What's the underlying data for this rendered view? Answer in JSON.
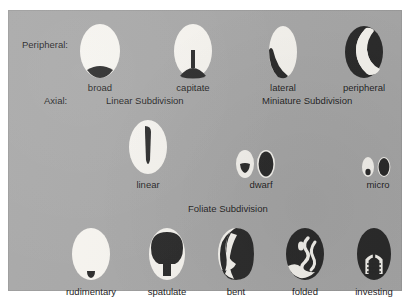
{
  "figure": {
    "background_color": "#ffffff",
    "plate_color": "#a8a8a8",
    "seed_body_color": "#f7f5f0",
    "embryo_color": "#2b2b2b"
  },
  "rows": {
    "peripheral_label": "Peripheral:",
    "axial_label": "Axial:"
  },
  "groups": {
    "linear": "Linear Subdivision",
    "miniature": "Miniature Subdivision",
    "foliate": "Foliate Subdivision"
  },
  "specimens": {
    "peripheral_row": [
      {
        "id": "broad",
        "caption": "broad"
      },
      {
        "id": "capitate",
        "caption": "capitate"
      },
      {
        "id": "lateral",
        "caption": "lateral"
      },
      {
        "id": "peripheral",
        "caption": "peripheral"
      }
    ],
    "axial_row": [
      {
        "id": "linear",
        "caption": "linear"
      },
      {
        "id": "dwarf",
        "caption": "dwarf"
      },
      {
        "id": "micro",
        "caption": "micro"
      }
    ],
    "foliate_row": [
      {
        "id": "rudimentary",
        "caption": "rudimentary"
      },
      {
        "id": "spatulate",
        "caption": "spatulate"
      },
      {
        "id": "bent",
        "caption": "bent"
      },
      {
        "id": "folded",
        "caption": "folded"
      },
      {
        "id": "investing",
        "caption": "investing"
      }
    ]
  }
}
